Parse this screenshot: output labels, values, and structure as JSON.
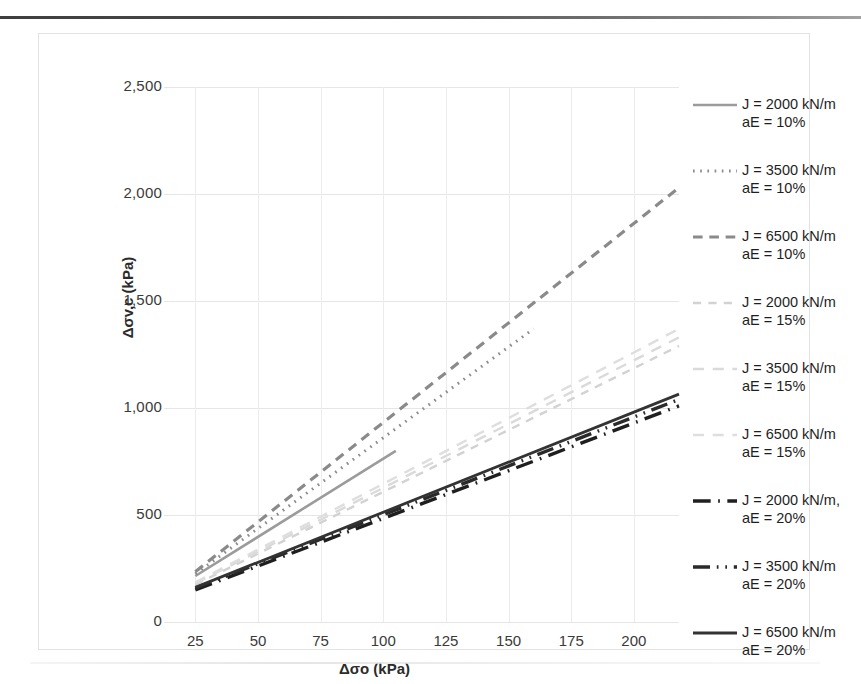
{
  "chart_data": {
    "type": "line",
    "title": "",
    "xlabel": "Δσo (kPa)",
    "ylabel": "Δσv,c (kPa)",
    "xlim": [
      12.5,
      218
    ],
    "ylim": [
      0,
      2500
    ],
    "xticks": [
      25,
      50,
      75,
      100,
      125,
      150,
      175,
      200
    ],
    "xtick_labels": [
      "25",
      "50",
      "75",
      "100",
      "125",
      "150",
      "175",
      "200"
    ],
    "yticks": [
      0,
      500,
      1000,
      1500,
      2000,
      2500
    ],
    "ytick_labels": [
      "0",
      "500",
      "1,000",
      "1,500",
      "2,000",
      "2,500"
    ],
    "grid": true,
    "grid_axis": "both",
    "legend_position": "right",
    "series": [
      {
        "name": "J = 2000 kN/m\naE = 10%",
        "J_kN_per_m": 2000,
        "aE_percent": 10,
        "style": "solid",
        "color": "#9b9b9b",
        "width": 2.6,
        "x": [
          25,
          105
        ],
        "y": [
          215,
          800
        ]
      },
      {
        "name": "J = 3500 kN/m\naE = 10%",
        "J_kN_per_m": 3500,
        "aE_percent": 10,
        "style": "dotted",
        "color": "#8c8c8c",
        "width": 3.0,
        "x": [
          25,
          160
        ],
        "y": [
          225,
          1370
        ]
      },
      {
        "name": "J = 6500 kN/m\naE = 10%",
        "J_kN_per_m": 6500,
        "aE_percent": 10,
        "style": "dashed",
        "color": "#8a8a8a",
        "width": 3.2,
        "x": [
          25,
          218
        ],
        "y": [
          235,
          2030
        ]
      },
      {
        "name": "J = 2000 kN/m\naE = 15%",
        "J_kN_per_m": 2000,
        "aE_percent": 15,
        "style": "dashed-faint",
        "color": "#d2d2d2",
        "width": 2.4,
        "x": [
          25,
          218
        ],
        "y": [
          175,
          1290
        ]
      },
      {
        "name": "J = 3500 kN/m\naE = 15%",
        "J_kN_per_m": 3500,
        "aE_percent": 15,
        "style": "dashed-faint-long",
        "color": "#dadada",
        "width": 2.4,
        "x": [
          25,
          218
        ],
        "y": [
          180,
          1330
        ]
      },
      {
        "name": "J = 6500 kN/m\naE = 15%",
        "J_kN_per_m": 6500,
        "aE_percent": 15,
        "style": "dashed-faint-long",
        "color": "#dedede",
        "width": 2.4,
        "x": [
          25,
          218
        ],
        "y": [
          185,
          1370
        ]
      },
      {
        "name": "J = 2000 kN/m,\naE = 20%",
        "J_kN_per_m": 2000,
        "aE_percent": 20,
        "style": "dash-dot-thick",
        "color": "#1f1f1f",
        "width": 3.4,
        "x": [
          25,
          218
        ],
        "y": [
          150,
          1010
        ]
      },
      {
        "name": "J = 3500 kN/m\naE = 20%",
        "J_kN_per_m": 3500,
        "aE_percent": 20,
        "style": "dash-dot-dot-thick",
        "color": "#2a2a2a",
        "width": 3.4,
        "x": [
          25,
          218
        ],
        "y": [
          158,
          1040
        ]
      },
      {
        "name": "J = 6500 kN/m\naE = 20%",
        "J_kN_per_m": 6500,
        "aE_percent": 20,
        "style": "solid-thick",
        "color": "#333333",
        "width": 2.8,
        "x": [
          25,
          218
        ],
        "y": [
          162,
          1065
        ]
      }
    ]
  },
  "axes": {
    "y_title": "Δσv,c (kPa)",
    "x_title": "Δσo (kPa)"
  },
  "legend": {
    "entries": [
      {
        "label": "J = 2000 kN/m\naE = 10%"
      },
      {
        "label": "J = 3500 kN/m\naE = 10%"
      },
      {
        "label": "J = 6500 kN/m\naE = 10%"
      },
      {
        "label": "J = 2000 kN/m\naE = 15%"
      },
      {
        "label": "J = 3500 kN/m\naE = 15%"
      },
      {
        "label": "J = 6500 kN/m\naE = 15%"
      },
      {
        "label": "J = 2000 kN/m,\naE = 20%"
      },
      {
        "label": "J = 3500 kN/m\naE = 20%"
      },
      {
        "label": "J = 6500 kN/m\naE = 20%"
      }
    ]
  }
}
